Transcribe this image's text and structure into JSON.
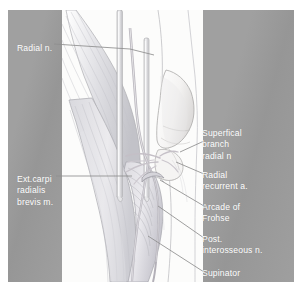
{
  "figure": {
    "kind": "anatomical-illustration",
    "style": "pencil line drawing, pale graphite shading",
    "colors": {
      "panel_gray": "#9b9b9b",
      "label_text": "#ffffff",
      "art_background": "#fcfcfb",
      "leader_line": "#8e8e8e",
      "pencil_dark": "#8d8d92",
      "pencil_mid": "#b4b4ba",
      "pencil_light": "#d8d8dd",
      "vessel_tint": "#c9c4cc"
    }
  },
  "labels": {
    "left": [
      {
        "id": "radial-n",
        "text": "Radial n."
      },
      {
        "id": "ext-carpi",
        "text": "Ext.carpi\nradialis\nbrevis m."
      }
    ],
    "right": [
      {
        "id": "superficial-branch-radial-n",
        "text": "Superfical\nbranch\nradial n"
      },
      {
        "id": "radial-recurrent-a",
        "text": "Radial\nrecurrent a."
      },
      {
        "id": "arcade-of-frohse",
        "text": "Arcade of\nFrohse"
      },
      {
        "id": "post-interosseous-n",
        "text": "Post.\ninterosseous n."
      },
      {
        "id": "supinator",
        "text": "Supinator"
      }
    ]
  },
  "structures": [
    "radial nerve",
    "superficial branch of radial nerve",
    "radial recurrent artery",
    "arcade of Frohse",
    "posterior interosseous nerve",
    "supinator muscle",
    "extensor carpi radialis brevis muscle",
    "lateral epicondyle of humerus",
    "brachioradialis muscle",
    "retractor"
  ]
}
